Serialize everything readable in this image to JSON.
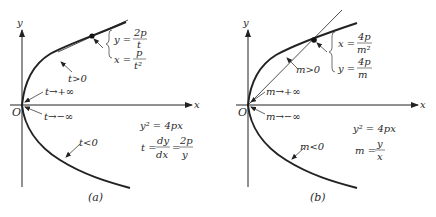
{
  "panels": [
    {
      "id": "a",
      "caption": "(a)",
      "axis_x": "x",
      "axis_y": "y",
      "origin": "O",
      "upper_branch_label": "t>0",
      "lower_branch_label": "t<0",
      "limit_upper": "t→+∞",
      "limit_lower": "t→−∞",
      "param_y_lhs": "y =",
      "param_y_num": "2p",
      "param_y_den": "t",
      "param_x_lhs": "x =",
      "param_x_num": "p",
      "param_x_den": "t²",
      "eq1": "y² = 4px",
      "eq2_lhs": "t =",
      "eq2_num1": "dy",
      "eq2_den1": "dx",
      "eq2_eq": "=",
      "eq2_num2": "2p",
      "eq2_den2": "y",
      "line_type": "tangent"
    },
    {
      "id": "b",
      "caption": "(b)",
      "axis_x": "x",
      "axis_y": "y",
      "origin": "O",
      "upper_branch_label": "m>0",
      "lower_branch_label": "m<0",
      "limit_upper": "m→+∞",
      "limit_lower": "m→−∞",
      "param_x_lhs": "x =",
      "param_x_num": "4p",
      "param_x_den": "m²",
      "param_y_lhs": "y =",
      "param_y_num": "4p",
      "param_y_den": "m",
      "eq1": "y² = 4px",
      "eq2_lhs": "m =",
      "eq2_num": "y",
      "eq2_den": "x",
      "line_type": "chord-through-origin"
    }
  ],
  "colors": {
    "ink": "#222222",
    "background": "#ffffff"
  }
}
